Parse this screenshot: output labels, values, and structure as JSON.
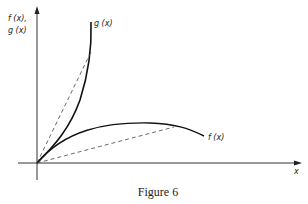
{
  "figure": {
    "caption": "Figure 6",
    "y_axis_label_line1": "f (x),",
    "y_axis_label_line2": "g (x)",
    "x_axis_label": "x",
    "curves": [
      {
        "name": "g",
        "label": "g (x)",
        "description": "convex, increasing steeply",
        "style": "solid"
      },
      {
        "name": "f",
        "label": "f (x)",
        "description": "concave, rising then falling",
        "style": "solid"
      }
    ],
    "chords": [
      {
        "from": "origin",
        "to_curve": "g",
        "style": "dashed"
      },
      {
        "from": "origin",
        "to_curve": "f",
        "style": "dashed"
      }
    ],
    "colors": {
      "ink": "#222222",
      "background": "#ffffff"
    }
  }
}
